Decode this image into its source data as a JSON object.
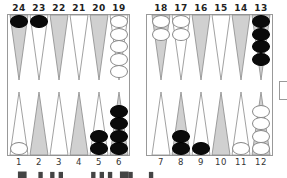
{
  "board": {
    "top_labels": [
      "24",
      "23",
      "22",
      "21",
      "20",
      "19",
      "18",
      "17",
      "16",
      "15",
      "14",
      "13"
    ],
    "bottom_labels": [
      "1",
      "2",
      "3",
      "4",
      "5",
      "6",
      "7",
      "8",
      "9",
      "10",
      "11",
      "12"
    ],
    "colors": {
      "dark_point": "#d0d0d0",
      "light_point": "#ffffff",
      "point_outline": "#8a8a8a",
      "black_checker": "#0a0a0a",
      "white_checker": "#ffffff",
      "border": "#999999"
    },
    "points": {
      "24": {
        "color": "black",
        "count": 1
      },
      "23": {
        "color": "black",
        "count": 1
      },
      "22": {
        "color": null,
        "count": 0
      },
      "21": {
        "color": null,
        "count": 0
      },
      "20": {
        "color": null,
        "count": 0
      },
      "19": {
        "color": "white",
        "count": 5
      },
      "18": {
        "color": "white",
        "count": 2
      },
      "17": {
        "color": "white",
        "count": 2
      },
      "16": {
        "color": null,
        "count": 0
      },
      "15": {
        "color": null,
        "count": 0
      },
      "14": {
        "color": null,
        "count": 0
      },
      "13": {
        "color": "black",
        "count": 4
      },
      "1": {
        "color": "white",
        "count": 1
      },
      "2": {
        "color": null,
        "count": 0
      },
      "3": {
        "color": null,
        "count": 0
      },
      "4": {
        "color": null,
        "count": 0
      },
      "5": {
        "color": "black",
        "count": 2
      },
      "6": {
        "color": "black",
        "count": 4
      },
      "7": {
        "color": null,
        "count": 0
      },
      "8": {
        "color": "black",
        "count": 2
      },
      "9": {
        "color": "black",
        "count": 1
      },
      "10": {
        "color": null,
        "count": 0
      },
      "11": {
        "color": "white",
        "count": 1
      },
      "12": {
        "color": "white",
        "count": 4
      }
    }
  },
  "caption": {
    "text": "▀▄ ▌ ▌▌ ▄▄ ▌▌▌ ▀▌ ▄▌"
  }
}
